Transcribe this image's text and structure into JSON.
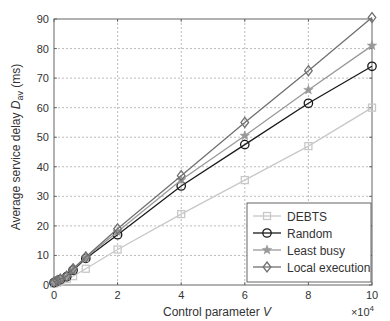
{
  "chart_data": {
    "type": "line",
    "title": "",
    "xlabel": "Control parameter V",
    "xlabel_parts": {
      "text": "Control parameter ",
      "var": "V"
    },
    "x_multiplier": "×10",
    "x_multiplier_exp": "4",
    "ylabel": "Average service delay D_av (ms)",
    "ylabel_parts": {
      "pre": "Average service delay ",
      "var": "D",
      "sub": "av",
      "post": " (ms)"
    },
    "xlim": [
      0,
      10
    ],
    "ylim": [
      0,
      90
    ],
    "xticks": [
      0,
      2,
      4,
      6,
      8,
      10
    ],
    "yticks": [
      0,
      10,
      20,
      30,
      40,
      50,
      60,
      70,
      80,
      90
    ],
    "grid": true,
    "legend_position": "lower right",
    "x": [
      0,
      0.1,
      0.2,
      0.4,
      0.6,
      1,
      2,
      4,
      6,
      8,
      10
    ],
    "series": [
      {
        "name": "DEBTS",
        "marker": "square",
        "color": "#c8c8c8",
        "values": [
          0.5,
          0.8,
          1.2,
          2,
          3,
          5.5,
          12,
          24,
          35.5,
          47,
          60
        ]
      },
      {
        "name": "Random",
        "marker": "circle",
        "color": "#1a1a1a",
        "values": [
          0.8,
          1.3,
          1.8,
          2.8,
          5,
          9,
          17,
          33.5,
          47.5,
          61.5,
          74
        ]
      },
      {
        "name": "Least busy",
        "marker": "star",
        "color": "#999999",
        "values": [
          0.9,
          1.4,
          1.9,
          2.9,
          5.2,
          9.3,
          18,
          35.5,
          50.5,
          66,
          81
        ]
      },
      {
        "name": "Local execution",
        "marker": "diamond",
        "color": "#707070",
        "values": [
          1,
          1.5,
          2,
          3,
          5.5,
          9.5,
          19,
          37,
          55,
          72.5,
          90.5
        ]
      }
    ]
  }
}
